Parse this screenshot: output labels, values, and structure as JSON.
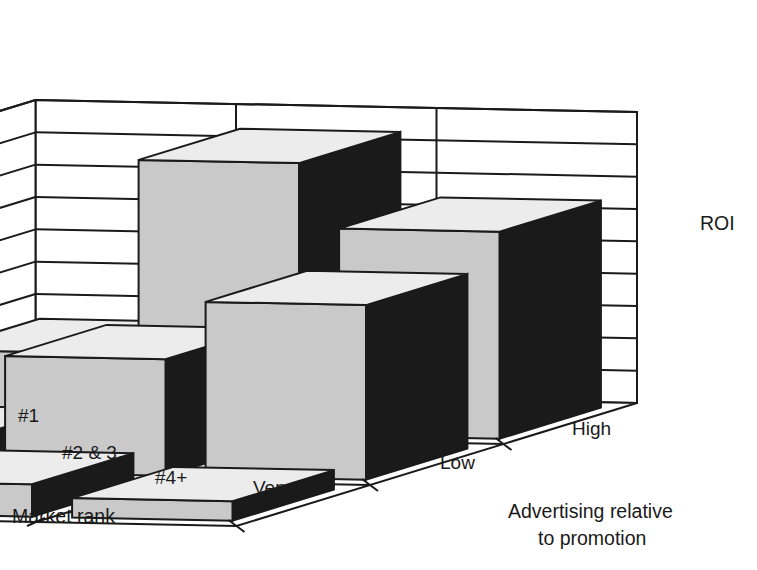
{
  "chart_data": {
    "type": "bar",
    "title": "",
    "subtitle": "",
    "is_3d": true,
    "xlabel": "Market rank",
    "ylabel": "Advertising relative to promotion",
    "zlabel": "ROI",
    "zlabel_display": "ROI",
    "categories": [
      "#1",
      "#2 & 3",
      "#4+"
    ],
    "depth_categories": [
      "Very low",
      "Low",
      "High"
    ],
    "ztick_labels": [
      "0",
      "5",
      "10",
      "15",
      "20",
      "25",
      "30",
      "35",
      "40",
      "45"
    ],
    "zticks": [
      0,
      5,
      10,
      15,
      20,
      25,
      30,
      35,
      40,
      45
    ],
    "zlim": [
      0,
      45
    ],
    "grid": true,
    "legend": false,
    "series": [
      {
        "name": "Very low",
        "values": [
          32,
          42,
          12
        ]
      },
      {
        "name": "Low",
        "values": [
          27,
          18,
          5
        ]
      },
      {
        "name": "High",
        "values": [
          3,
          5,
          2
        ]
      }
    ],
    "annotations": [],
    "colors": {
      "bar_front": "#c9c9c9",
      "bar_side": "#1a1a1a",
      "bar_top": "#ececec",
      "outline": "#1a1a1a",
      "background": "#ffffff",
      "grid": "#1a1a1a"
    }
  },
  "axes": {
    "x_axis_title": "Market rank",
    "y_axis_title_line1": "Advertising relative",
    "y_axis_title_line2": "to promotion",
    "z_axis_title": "ROI"
  }
}
